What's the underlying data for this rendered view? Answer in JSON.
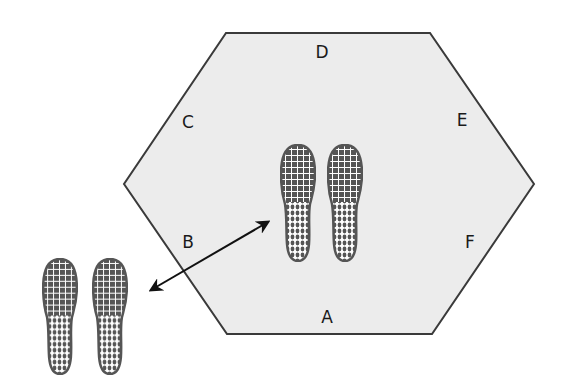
{
  "diagram": {
    "type": "hexagon-stepping-drill",
    "colors": {
      "hex_fill": "#ececec",
      "hex_stroke": "#3a3a3a",
      "sole": "#555555",
      "arrow": "#111111"
    },
    "hexagon": {
      "vertices": [
        [
          226,
          33
        ],
        [
          430,
          33
        ],
        [
          534,
          184
        ],
        [
          432,
          334
        ],
        [
          227,
          334
        ],
        [
          124,
          184
        ]
      ]
    },
    "labels": [
      {
        "id": "D",
        "text": "D",
        "x": 322,
        "y": 58
      },
      {
        "id": "C",
        "text": "C",
        "x": 188,
        "y": 128
      },
      {
        "id": "E",
        "text": "E",
        "x": 462,
        "y": 126
      },
      {
        "id": "B",
        "text": "B",
        "x": 188,
        "y": 248
      },
      {
        "id": "F",
        "text": "F",
        "x": 470,
        "y": 248
      },
      {
        "id": "A",
        "text": "A",
        "x": 327,
        "y": 323
      }
    ],
    "footprints": [
      {
        "id": "center",
        "left_sole": {
          "x": 280,
          "y": 144,
          "w": 36,
          "h": 118
        },
        "right_sole": {
          "x": 327,
          "y": 144,
          "w": 36,
          "h": 118
        }
      },
      {
        "id": "outside",
        "left_sole": {
          "x": 42,
          "y": 258,
          "w": 36,
          "h": 117
        },
        "right_sole": {
          "x": 92,
          "y": 258,
          "w": 36,
          "h": 117
        }
      }
    ],
    "arrow": {
      "x1": 151,
      "y1": 290,
      "x2": 268,
      "y2": 222,
      "bidirectional": true
    }
  }
}
